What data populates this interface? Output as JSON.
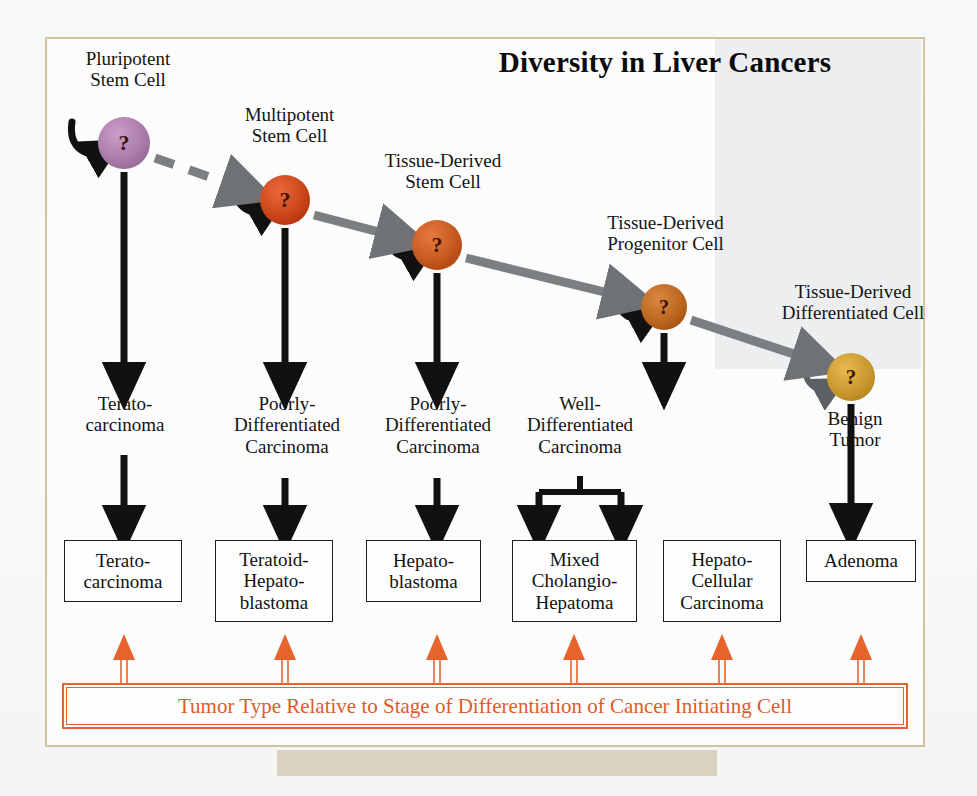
{
  "title": "Diversity in Liver Cancers",
  "banner": {
    "text": "Tumor Type Relative to Stage of Differentiation of Cancer Initiating Cell",
    "color": "#e05a2b"
  },
  "cells": [
    {
      "name": "Pluripotent\nStem Cell",
      "glyph": "?",
      "color": "#a87ba8",
      "cx": 124,
      "cy": 143,
      "r": 26
    },
    {
      "name": "Multipotent\nStem Cell",
      "glyph": "?",
      "color": "#c9451a",
      "cx": 285,
      "cy": 200,
      "r": 25
    },
    {
      "name": "Tissue-Derived\nStem Cell",
      "glyph": "?",
      "color": "#c4581f",
      "cx": 437,
      "cy": 245,
      "r": 25
    },
    {
      "name": "Tissue-Derived\nProgenitor Cell",
      "glyph": "?",
      "color": "#ba6520",
      "cx": 664,
      "cy": 307,
      "r": 23
    },
    {
      "name": "Tissue-Derived\nDifferentiated Cell",
      "glyph": "?",
      "color": "#c8982f",
      "cx": 851,
      "cy": 377,
      "r": 24
    }
  ],
  "cell_labels": [
    {
      "text": "Pluripotent\nStem Cell",
      "x": 63,
      "y": 48,
      "w": 130
    },
    {
      "text": "Multipotent\nStem Cell",
      "x": 222,
      "y": 104,
      "w": 135
    },
    {
      "text": "Tissue-Derived\nStem Cell",
      "x": 368,
      "y": 150,
      "w": 150
    },
    {
      "text": "Tissue-Derived\nProgenitor Cell",
      "x": 578,
      "y": 212,
      "w": 175
    },
    {
      "text": "Tissue-Derived\nDifferentiated Cell",
      "x": 758,
      "y": 281,
      "w": 190
    }
  ],
  "tumor_types": [
    {
      "text": "Terato-\ncarcinoma",
      "x": 60,
      "y": 393,
      "w": 130
    },
    {
      "text": "Poorly-\nDifferentiated\nCarcinoma",
      "x": 207,
      "y": 393,
      "w": 160
    },
    {
      "text": "Poorly-\nDifferentiated\nCarcinoma",
      "x": 358,
      "y": 393,
      "w": 160
    },
    {
      "text": "Well-\nDifferentiated\nCarcinoma",
      "x": 500,
      "y": 393,
      "w": 160
    },
    {
      "text": "Benign\nTumor",
      "x": 800,
      "y": 408,
      "w": 110
    }
  ],
  "tumor_boxes": [
    {
      "text": "Terato-\ncarcinoma",
      "x": 64,
      "y": 540,
      "w": 118,
      "h": 62
    },
    {
      "text": "Teratoid-\nHepato-\nblastoma",
      "x": 215,
      "y": 540,
      "w": 118,
      "h": 82
    },
    {
      "text": "Hepato-\nblastoma",
      "x": 366,
      "y": 540,
      "w": 115,
      "h": 62
    },
    {
      "text": "Mixed\nCholangio-\nHepatoma",
      "x": 512,
      "y": 540,
      "w": 125,
      "h": 82
    },
    {
      "text": "Hepato-\nCellular\nCarcinoma",
      "x": 663,
      "y": 540,
      "w": 118,
      "h": 82
    },
    {
      "text": "Adenoma",
      "x": 806,
      "y": 540,
      "w": 110,
      "h": 42
    }
  ],
  "lineage_arrows": [
    {
      "style": "dashed",
      "from": "Pluripotent Stem Cell",
      "to": "Multipotent Stem Cell"
    },
    {
      "style": "solid",
      "from": "Multipotent Stem Cell",
      "to": "Tissue-Derived Stem Cell"
    },
    {
      "style": "solid",
      "from": "Tissue-Derived Stem Cell",
      "to": "Tissue-Derived Progenitor Cell"
    },
    {
      "style": "solid",
      "from": "Tissue-Derived Progenitor Cell",
      "to": "Tissue-Derived Differentiated Cell"
    }
  ],
  "colors": {
    "frame": "#cfc49e",
    "shade": "#eceef0",
    "arrow_black": "#111111",
    "arrow_gray": "#6e7275",
    "banner_orange": "#e8622c"
  }
}
